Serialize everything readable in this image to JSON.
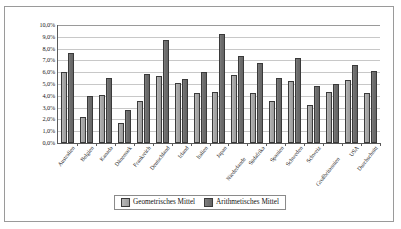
{
  "chart_data": {
    "type": "bar",
    "title": "",
    "xlabel": "",
    "ylabel": "",
    "ylim": [
      0,
      10
    ],
    "grid": true,
    "legend_position": "bottom",
    "ytick_labels": [
      "10,0%",
      "9,0%",
      "8,0%",
      "7,0%",
      "6,0%",
      "5,0%",
      "4,0%",
      "3,0%",
      "2,0%",
      "1,0%",
      "0,0%"
    ],
    "ytick_values": [
      10,
      9,
      8,
      7,
      6,
      5,
      4,
      3,
      2,
      1,
      0
    ],
    "categories": [
      "Australien",
      "Belgien",
      "Kanada",
      "Dänemark",
      "Frankreich",
      "Deutschland",
      "Irland",
      "Italien",
      "Japan",
      "Niederlande",
      "Südafrika",
      "Spanien",
      "Schweden",
      "Schweiz",
      "Großbritannien",
      "USA",
      "Durchschnitt"
    ],
    "series": [
      {
        "name": "Geometrisches Mittel",
        "color": "#a8a8a8",
        "values": [
          6.0,
          2.2,
          4.05,
          1.7,
          3.6,
          5.7,
          5.05,
          4.25,
          4.35,
          5.75,
          4.2,
          3.6,
          5.25,
          3.2,
          4.3,
          5.3,
          4.25
        ]
      },
      {
        "name": "Arithmetisches Mittel",
        "color": "#6e6e6e",
        "values": [
          7.6,
          4.0,
          5.5,
          2.8,
          5.85,
          8.75,
          5.4,
          6.0,
          9.25,
          7.4,
          6.8,
          5.5,
          7.2,
          4.85,
          5.0,
          6.6,
          6.1
        ]
      }
    ]
  },
  "legend": {
    "items": [
      {
        "label": "Geometrisches Mittel"
      },
      {
        "label": "Arithmetisches Mittel"
      }
    ]
  }
}
